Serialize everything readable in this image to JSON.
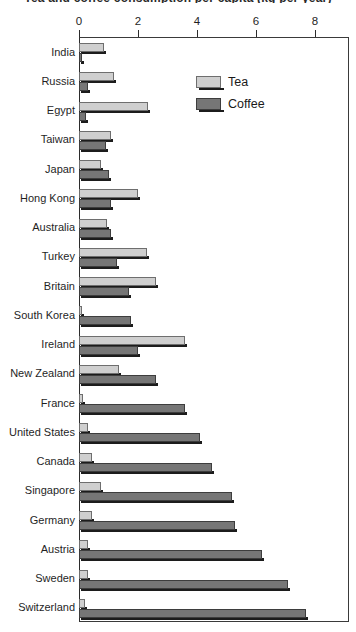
{
  "chart_data": {
    "type": "bar",
    "orientation": "horizontal",
    "title": "Tea and coffee consumption per capita (kg per year)",
    "xlabel": "",
    "ylabel": "",
    "xlim": [
      0,
      9.2
    ],
    "xticks": [
      0,
      2,
      4,
      6,
      8
    ],
    "xtick_labels": [
      "0",
      "2",
      "4",
      "6",
      "8"
    ],
    "grid": false,
    "legend_position": "upper right inside",
    "categories": [
      "India",
      "Russia",
      "Egypt",
      "Taiwan",
      "Japan",
      "Hong Kong",
      "Australia",
      "Turkey",
      "Britain",
      "South Korea",
      "Ireland",
      "New Zealand",
      "France",
      "United States",
      "Canada",
      "Singapore",
      "Germany",
      "Austria",
      "Sweden",
      "Switzerland"
    ],
    "series": [
      {
        "name": "Tea",
        "color": "#cfcfcf",
        "values": [
          0.85,
          1.2,
          2.35,
          1.1,
          0.75,
          2.0,
          0.95,
          2.3,
          2.6,
          0.1,
          3.6,
          1.35,
          0.15,
          0.3,
          0.45,
          0.75,
          0.45,
          0.3,
          0.3,
          0.2
        ]
      },
      {
        "name": "Coffee",
        "color": "#767676",
        "values": [
          0.1,
          0.3,
          0.25,
          0.9,
          1.0,
          1.1,
          1.1,
          1.3,
          1.7,
          1.75,
          2.0,
          2.6,
          3.6,
          4.1,
          4.5,
          5.2,
          5.3,
          6.2,
          7.1,
          7.7
        ]
      }
    ]
  },
  "legend": {
    "entries": [
      {
        "label": "Tea",
        "swatch": "tea"
      },
      {
        "label": "Coffee",
        "swatch": "coffee"
      }
    ]
  }
}
